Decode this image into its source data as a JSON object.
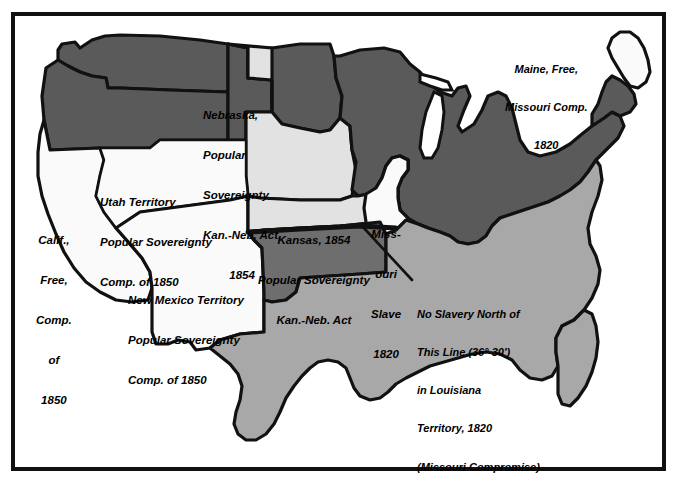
{
  "figure": {
    "kind": "historical-thematic-map",
    "frame_color": "#111111",
    "background_color": "#ffffff"
  },
  "palette": {
    "free_states_dark_gray": "#5a5a5a",
    "popular_sovereignty_light_gray": "#e2e2e2",
    "slave_states_medium_gray": "#a8a8a8",
    "indian_territory_dark_gray": "#6e6e6e",
    "unorganized_white": "#fafafa",
    "outline_black": "#111111",
    "lake_white": "#ffffff"
  },
  "labels": {
    "nebraska": {
      "name": "Nebraska Territory",
      "lines": [
        "Nebraska,",
        "Popular",
        "Sovereignty",
        "Kan.-Neb. Act,",
        "1854"
      ]
    },
    "maine": {
      "name": "Maine",
      "lines": [
        "Maine, Free,",
        "Missouri Comp.",
        "1820"
      ]
    },
    "utah": {
      "name": "Utah Territory",
      "lines": [
        "Utah Territory",
        "Popular Sovereignty",
        "Comp. of 1850"
      ]
    },
    "california": {
      "name": "California",
      "lines": [
        "Calif.,",
        "Free,",
        "Comp.",
        "of",
        "1850"
      ]
    },
    "new_mexico": {
      "name": "New Mexico Territory",
      "lines": [
        "New Mexico Territory",
        "Popular Sovereignty",
        "Comp. of 1850"
      ]
    },
    "kansas": {
      "name": "Kansas Territory",
      "lines": [
        "Kansas, 1854",
        "Popular Sovereignty",
        "Kan.-Neb. Act"
      ]
    },
    "missouri": {
      "name": "Missouri",
      "lines": [
        "Miss-",
        "ouri",
        "Slave",
        "1820"
      ]
    },
    "compromise_line": {
      "name": "Missouri Compromise line annotation",
      "lines": [
        "No Slavery North of",
        "This Line (36° 30')",
        "in Louisiana",
        "Territory, 1820",
        "(Missouri Compromise)"
      ]
    }
  },
  "map_data": {
    "type": "choropleth-categories",
    "categories": [
      {
        "key": "free",
        "label": "Free states and territories",
        "color": "#5a5a5a"
      },
      {
        "key": "popular_sovereignty",
        "label": "Popular sovereignty (Kansas-Nebraska Act, 1854)",
        "color": "#e2e2e2"
      },
      {
        "key": "slave",
        "label": "Slave states",
        "color": "#a8a8a8"
      },
      {
        "key": "unorganized",
        "label": "Compromise of 1850 territories / highlighted states",
        "color": "#fafafa"
      },
      {
        "key": "indian_territory",
        "label": "Indian Territory",
        "color": "#6e6e6e"
      }
    ],
    "regions": [
      {
        "name": "Washington Territory",
        "category": "free"
      },
      {
        "name": "Oregon",
        "category": "free"
      },
      {
        "name": "Minnesota / Northern free region",
        "category": "free"
      },
      {
        "name": "Northeast free states",
        "category": "free"
      },
      {
        "name": "Nebraska Territory",
        "category": "popular_sovereignty"
      },
      {
        "name": "Kansas Territory",
        "category": "popular_sovereignty"
      },
      {
        "name": "California",
        "category": "unorganized"
      },
      {
        "name": "Utah Territory",
        "category": "unorganized"
      },
      {
        "name": "New Mexico Territory",
        "category": "unorganized"
      },
      {
        "name": "Missouri",
        "category": "unorganized"
      },
      {
        "name": "Maine",
        "category": "unorganized"
      },
      {
        "name": "Southern slave states",
        "category": "slave"
      },
      {
        "name": "Texas",
        "category": "slave"
      },
      {
        "name": "Indian Territory",
        "category": "indian_territory"
      }
    ],
    "annotation_line": {
      "name": "36 degrees 30 minutes parallel",
      "text": "36° 30'",
      "description": "Thick black line marking the Missouri Compromise boundary"
    }
  }
}
